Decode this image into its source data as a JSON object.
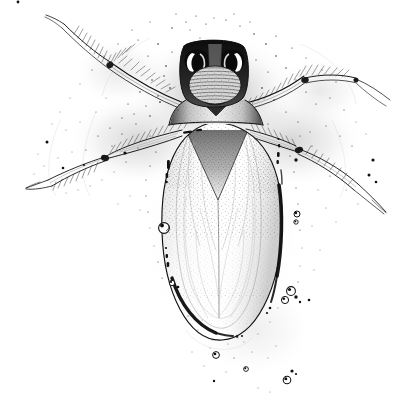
{
  "artwork": {
    "title": "Aquatic beetle dorsal view",
    "medium": "pen-and-ink stipple illustration",
    "subject_common_name": "water boatman / backswimmer",
    "view": "dorsal",
    "background_color": "#ffffff",
    "ink_color": "#111111",
    "canvas": {
      "width": 417,
      "height": 408
    }
  },
  "anatomy": {
    "head": {
      "label": "head",
      "center": {
        "x": 213,
        "y": 72
      },
      "width": 62,
      "height": 56,
      "notes": "dark capsule with paired compound eyes"
    },
    "eyes": [
      {
        "label": "left-compound-eye",
        "cx": 198,
        "cy": 62,
        "rx": 12,
        "ry": 11,
        "highlight": "white crescent"
      },
      {
        "label": "right-compound-eye",
        "cx": 233,
        "cy": 62,
        "rx": 12,
        "ry": 11,
        "highlight": "white crescent"
      }
    ],
    "frons": {
      "label": "frons-clypeus",
      "cx": 215,
      "cy": 85,
      "rx": 26,
      "ry": 19,
      "striation_count": 13
    },
    "pronotum": {
      "label": "pronotum",
      "cy": 112,
      "width": 78
    },
    "scutellum": {
      "label": "scutellum",
      "apex": {
        "x": 215,
        "y": 130
      },
      "shape": "inverted triangle"
    },
    "elytra": {
      "label": "elytra-wing-covers",
      "wedge_apex": {
        "x": 218,
        "y": 200
      },
      "shading": "stipple"
    },
    "abdomen": {
      "label": "abdomen",
      "cx": 222,
      "cy": 230,
      "rx": 60,
      "ry": 115,
      "outline": "elongate oval",
      "highlight_side": "right",
      "air_film_inner_outline": true
    },
    "legs": [
      {
        "label": "left-foreleg",
        "direction": "upper-left",
        "tip": {
          "x": 62,
          "y": 17
        },
        "fringed": true
      },
      {
        "label": "right-foreleg",
        "direction": "upper-right",
        "tip": {
          "x": 390,
          "y": 98
        },
        "fringed": true
      },
      {
        "label": "left-hindleg",
        "direction": "lower-left",
        "tip": {
          "x": 28,
          "y": 190
        },
        "fringed": true
      },
      {
        "label": "right-hindleg",
        "direction": "lower-right",
        "tip": {
          "x": 392,
          "y": 215
        },
        "fringed": true
      }
    ]
  },
  "bubbles": [
    {
      "label": "bubble-left-abdomen",
      "cx": 164,
      "cy": 228,
      "r": 5.4
    },
    {
      "label": "bubble-right-upper",
      "cx": 297,
      "cy": 214,
      "r": 3.0
    },
    {
      "label": "bubble-right-mid",
      "cx": 291,
      "cy": 291,
      "r": 4.4
    },
    {
      "label": "bubble-right-low",
      "cx": 288,
      "cy": 300,
      "r": 3.6
    },
    {
      "label": "bubble-right-small",
      "cx": 294,
      "cy": 296,
      "r": 2.0
    },
    {
      "label": "bubble-left-low",
      "cx": 172,
      "cy": 283,
      "r": 2.6
    },
    {
      "label": "bubble-below-left",
      "cx": 216,
      "cy": 355,
      "r": 3.4
    },
    {
      "label": "bubble-below-mid",
      "cx": 246,
      "cy": 369,
      "r": 2.4
    },
    {
      "label": "bubble-below-right",
      "cx": 287,
      "cy": 380,
      "r": 3.8
    },
    {
      "label": "bubble-below-right-small",
      "cx": 292,
      "cy": 371,
      "r": 1.8
    },
    {
      "label": "bubble-far-right",
      "cx": 309,
      "cy": 300,
      "r": 1.6
    }
  ],
  "specks": {
    "label": "stipple-specks",
    "description": "scattered ink dots forming diffuse halo around the body and legs",
    "count": 260
  }
}
